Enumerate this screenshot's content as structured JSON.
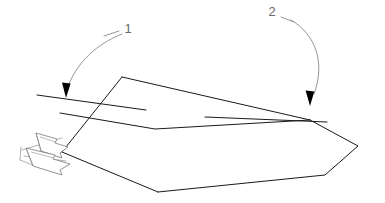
{
  "figure": {
    "background_color": "#ffffff",
    "line_color": "#1a1a1a",
    "leader_color": "#8a8a8a",
    "label_color": "#6b6b6b",
    "arrowhead_fill": "#000000",
    "hinge_arrow_stroke": "#777777",
    "hinge_arrow_fill": "#ffffff",
    "width": 385,
    "height": 203
  },
  "callouts": [
    {
      "id": "callout-1",
      "label": "1",
      "label_x": 128,
      "label_y": 30,
      "tick_path": "M 104 36 L 119 31",
      "leader_path": "M 122 34 C 104 41 80 56 68 86",
      "arrow_path": "M 66 98 L 62.0 82.5 L 70.6 83.6 Z",
      "points_to": "left-reference-line"
    },
    {
      "id": "callout-2",
      "label": "2",
      "label_x": 272,
      "label_y": 13,
      "tick_path": "M 281 17 L 294 22",
      "leader_path": "M 291 20 C 315 34 326 62 314 94",
      "arrow_path": "M 310 106 L 305.6 90.6 L 314.3 91.4 Z",
      "points_to": "right-reference-line"
    }
  ],
  "reference_lines": [
    {
      "id": "left-reference-line",
      "path": "M 37 95 L 146 110"
    },
    {
      "id": "right-reference-line",
      "path": "M 205 117 L 327 122"
    }
  ],
  "panel": {
    "upper_face_path": "M 122 77 L 310 120 L 155 129 L 60 113 Z",
    "lower_face_path": "M 60 113 L 155 129 L 310 120 L 358 146 L 325 175 L 158 192 L 62 152 Z",
    "fold_edge_path": "M 60 113 L 155 129 L 310 120",
    "left_edge_path": "M 122 77 L 62 152",
    "bottom_edge_path": "M 62 152 L 158 192",
    "right_edges_path": "M 310 120 L 358 146 L 325 175 L 158 192",
    "top_edge_path": "M 122 77 L 310 120"
  },
  "hinge_arrows": [
    {
      "id": "hinge-arrow-upper",
      "body_path": "M 36 133 L 57 139 L 55 143 L 68 147 L 60 153 L 62 158 L 41 151 Z",
      "detail_path_a": "M 36 133 L 41 151",
      "detail_path_b": "M 40 137 L 56 142"
    },
    {
      "id": "hinge-arrow-lower",
      "body_path": "M 26 148 L 55 155 L 53 159 L 70 164 L 60 170 L 62 175 L 33 166 Z",
      "detail_path_a": "M 26 148 L 33 166",
      "detail_path_b": "M 31 152 L 54 158"
    }
  ],
  "hinge_guide_lines": [
    {
      "id": "hinge-guide-1",
      "path": "M 22 150 L 62 138"
    },
    {
      "id": "hinge-guide-2",
      "path": "M 24 156 L 66 161"
    },
    {
      "id": "hinge-guide-3",
      "path": "M 21 147 L 20 160"
    },
    {
      "id": "hinge-guide-4",
      "path": "M 20 160 L 40 168"
    }
  ]
}
